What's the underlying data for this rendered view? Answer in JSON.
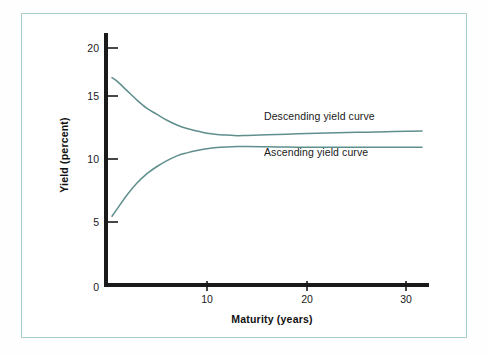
{
  "figure": {
    "background_color": "#ffffff",
    "frame_color": "#a8cfcb",
    "axis_color": "#1a1a1a"
  },
  "chart_data": {
    "type": "line",
    "title": "",
    "subtitle": "",
    "xlabel": "Maturity (years)",
    "ylabel": "Yield (percent)",
    "xlim": [
      0,
      32
    ],
    "ylim": [
      0,
      22
    ],
    "xticks": [
      10,
      20,
      30
    ],
    "xticklabels": [
      "10",
      "20",
      "30"
    ],
    "yticks": [
      0,
      5,
      10,
      15,
      20
    ],
    "yticklabels": [
      "0",
      "5",
      "10",
      "15",
      "20"
    ],
    "grid": false,
    "legend": "inline-annotations",
    "legend_position": "inside-right",
    "series": [
      {
        "name": "Descending yield curve",
        "color": "#5f8f8d",
        "annotation": "Descending yield curve",
        "x": [
          0.5,
          1,
          2,
          3,
          4,
          5,
          6,
          7,
          8,
          9,
          10,
          11,
          12,
          13,
          14,
          16,
          18,
          20,
          22,
          24,
          26,
          28,
          30,
          31.5
        ],
        "y": [
          17.5,
          17.2,
          16.4,
          15.6,
          14.9,
          14.4,
          13.9,
          13.5,
          13.2,
          13.0,
          12.8,
          12.7,
          12.65,
          12.6,
          12.62,
          12.68,
          12.73,
          12.78,
          12.82,
          12.86,
          12.9,
          12.94,
          12.98,
          13.0
        ]
      },
      {
        "name": "Ascending yield curve",
        "color": "#5f8f8d",
        "annotation": "Ascending yield curve",
        "x": [
          0.5,
          1,
          2,
          3,
          4,
          5,
          6,
          7,
          8,
          9,
          10,
          11,
          12,
          13,
          14,
          16,
          18,
          20,
          22,
          24,
          26,
          28,
          30,
          31.5
        ],
        "y": [
          5.8,
          6.4,
          7.6,
          8.6,
          9.4,
          10.0,
          10.5,
          10.9,
          11.15,
          11.35,
          11.5,
          11.6,
          11.65,
          11.68,
          11.68,
          11.66,
          11.64,
          11.63,
          11.62,
          11.62,
          11.62,
          11.62,
          11.62,
          11.62
        ]
      }
    ]
  },
  "annotations": {
    "descending_label": "Descending yield curve",
    "ascending_label": "Ascending yield curve"
  }
}
